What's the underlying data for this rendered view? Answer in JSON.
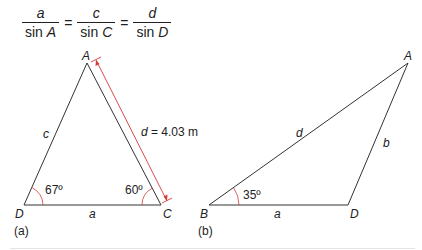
{
  "formula": {
    "terms": [
      {
        "numerator": "a",
        "denominator_fn": "sin",
        "denominator_var": "A"
      },
      {
        "numerator": "c",
        "denominator_fn": "sin",
        "denominator_var": "C"
      },
      {
        "numerator": "d",
        "denominator_fn": "sin",
        "denominator_var": "D"
      }
    ],
    "equals": "="
  },
  "figure_a": {
    "caption": "(a)",
    "vertices": {
      "top": "A",
      "bottom_left": "D",
      "bottom_right": "C"
    },
    "sides": {
      "left": "c",
      "bottom": "a"
    },
    "dimension_label_var": "d",
    "dimension_label_value": " = 4.03 m",
    "angles": {
      "D": "67º",
      "C": "60º"
    }
  },
  "figure_b": {
    "caption": "(b)",
    "vertices": {
      "top_right": "A",
      "bottom_left": "B",
      "bottom_right": "D"
    },
    "sides": {
      "hypotenuse": "d",
      "right": "b",
      "bottom": "a"
    },
    "angles": {
      "B": "35º"
    }
  },
  "colors": {
    "line": "#333333",
    "accent": "#d43a3a"
  }
}
